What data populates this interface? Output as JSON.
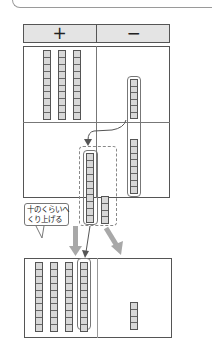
{
  "header": {
    "plus_label": "+",
    "minus_label": "−"
  },
  "callout": {
    "line1": "十のくらいへ",
    "line2": "くり上げる"
  },
  "diagram": {
    "top_grid": {
      "plus_tens_rods": 3,
      "rod_blocks": 10,
      "minus_upper_blocks": 6,
      "minus_lower_blocks": 8
    },
    "regroup_box": {
      "ten_rod_blocks": 10,
      "ones_blocks": 4
    },
    "bottom_grid": {
      "plus_tens_rods": 4,
      "minus_ones_blocks_visible": 4
    },
    "colors": {
      "block_fill": "#d8d8d8",
      "header_fill": "#e4e4e4",
      "arrow_gray": "#a8a8a8",
      "line_dark": "#555555"
    }
  }
}
